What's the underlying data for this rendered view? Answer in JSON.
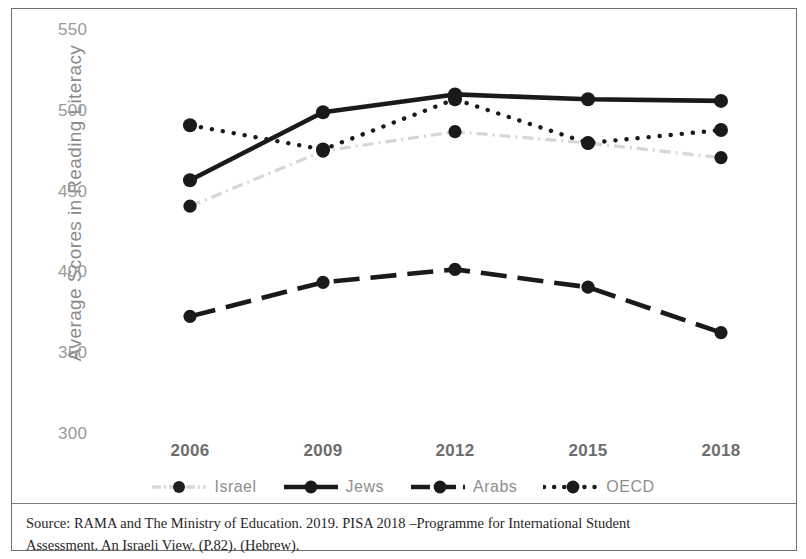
{
  "chart_data": {
    "type": "line",
    "title": "",
    "xlabel": "",
    "ylabel": "Average Scores in Reading Literacy",
    "categories": [
      "2006",
      "2009",
      "2012",
      "2015",
      "2018"
    ],
    "x": [
      2006,
      2009,
      2012,
      2015,
      2018
    ],
    "ylim": [
      300,
      550
    ],
    "yticks": [
      550,
      500,
      450,
      400,
      350,
      300
    ],
    "grid": false,
    "legend_position": "bottom",
    "series": [
      {
        "name": "Israel",
        "values": [
          440,
          474,
          486,
          479,
          470
        ],
        "style": "dash-dot",
        "color": "#d6d6d6",
        "marker": "circle"
      },
      {
        "name": "Jews",
        "values": [
          456,
          498,
          509,
          506,
          505
        ],
        "style": "solid",
        "color": "#1a1a1a",
        "marker": "circle"
      },
      {
        "name": "Arabs",
        "values": [
          372,
          393,
          401,
          390,
          362
        ],
        "style": "long-dash",
        "color": "#1a1a1a",
        "marker": "circle"
      },
      {
        "name": "OECD",
        "values": [
          490,
          475,
          506,
          479,
          487
        ],
        "style": "dotted",
        "color": "#1a1a1a",
        "marker": "circle"
      }
    ]
  },
  "axes": {
    "y_title": "Average Scores in Reading Literacy",
    "y_ticks": [
      "550",
      "500",
      "450",
      "400",
      "350",
      "300"
    ],
    "x_ticks": [
      "2006",
      "2009",
      "2012",
      "2015",
      "2018"
    ]
  },
  "legend": {
    "items": [
      {
        "label": "Israel",
        "key": "israel-legend-key"
      },
      {
        "label": "Jews",
        "key": "jews-legend-key"
      },
      {
        "label": "Arabs",
        "key": "arabs-legend-key"
      },
      {
        "label": "OECD",
        "key": "oecd-legend-key"
      }
    ]
  },
  "source": {
    "line1": "Source: RAMA and The Ministry of Education. 2019. PISA 2018 –Programme for International Student",
    "line2": "Assessment. An Israeli View. (P.82). (Hebrew)."
  }
}
